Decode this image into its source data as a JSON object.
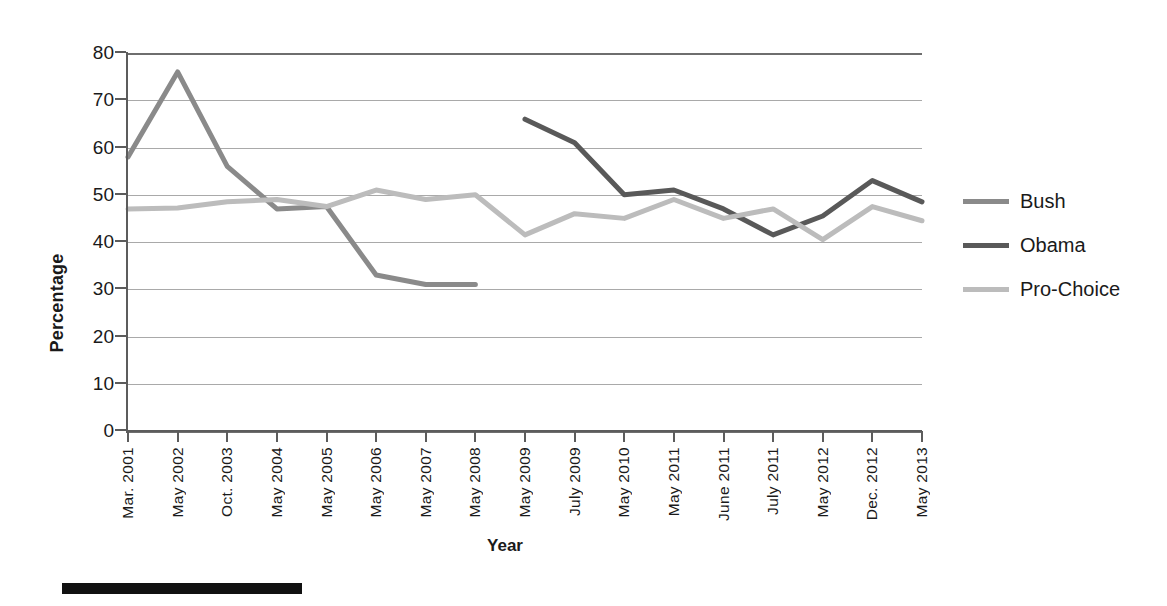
{
  "chart_data": {
    "type": "line",
    "title": "",
    "xlabel": "Year",
    "ylabel": "Percentage",
    "ylim": [
      0,
      80
    ],
    "ytick_step": 10,
    "yticks": [
      "0",
      "10",
      "20",
      "30",
      "40",
      "50",
      "60",
      "70",
      "80"
    ],
    "grid": true,
    "legend_position": "right",
    "categories": [
      "Mar. 2001",
      "May 2002",
      "Oct. 2003",
      "May 2004",
      "May 2005",
      "May 2006",
      "May 2007",
      "May 2008",
      "May 2009",
      "July 2009",
      "May 2010",
      "May 2011",
      "June 2011",
      "July 2011",
      "May 2012",
      "Dec. 2012",
      "May 2013"
    ],
    "series": [
      {
        "name": "Bush",
        "color": "#8a8a8a",
        "values": [
          58,
          76,
          56,
          47,
          47.5,
          33,
          31,
          31,
          null,
          null,
          null,
          null,
          null,
          null,
          null,
          null,
          null
        ]
      },
      {
        "name": "Obama",
        "color": "#595959",
        "values": [
          null,
          null,
          null,
          null,
          null,
          null,
          null,
          null,
          66,
          61,
          50,
          51,
          47,
          41.5,
          45.5,
          53,
          48.5
        ]
      },
      {
        "name": "Pro-Choice",
        "color": "#bcbcbc",
        "values": [
          47,
          47.2,
          48.5,
          49,
          47.5,
          51,
          49,
          50,
          41.5,
          46,
          45,
          49,
          45,
          47,
          40.5,
          47.5,
          44.5
        ]
      }
    ]
  },
  "legend": {
    "items": [
      {
        "label": "Bush",
        "color": "#8a8a8a"
      },
      {
        "label": "Obama",
        "color": "#595959"
      },
      {
        "label": "Pro-Choice",
        "color": "#bcbcbc"
      }
    ]
  },
  "axis_titles": {
    "y": "Percentage",
    "x": "Year"
  }
}
